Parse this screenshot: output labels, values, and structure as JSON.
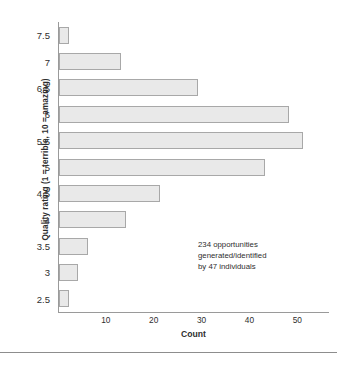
{
  "chart_data": {
    "type": "bar",
    "orientation": "horizontal",
    "title": "",
    "xlabel": "Count",
    "ylabel": "Quality rating (1 = terrible, 10 = amazing)",
    "categories": [
      "7.5",
      "7",
      "6.5",
      "6",
      "5.5",
      "5",
      "4.5",
      "4",
      "3.5",
      "3",
      "2.5"
    ],
    "values": [
      2,
      13,
      29,
      48,
      51,
      43,
      21,
      14,
      6,
      4,
      2
    ],
    "xlim": [
      0,
      56
    ],
    "xticks": [
      "10",
      "20",
      "30",
      "40",
      "50"
    ],
    "xtick_values": [
      10,
      20,
      30,
      40,
      50
    ],
    "grid": false,
    "legend": false,
    "bar_fill": "#e9e9e9",
    "bar_border": "#a8a8a8",
    "axis_color": "#9a9a9a",
    "annotation": {
      "line1": "234 opportunities",
      "line2": "generated/identified",
      "line3": "by 47 individuals"
    }
  }
}
